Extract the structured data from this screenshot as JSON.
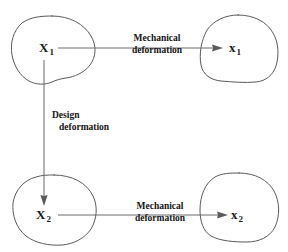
{
  "figure": {
    "type": "diagram",
    "title": "",
    "background_color": "#ffffff",
    "stroke_color": "#5a5a5a",
    "text_color": "#1a1a1a"
  },
  "nodes": [
    {
      "id": "X1",
      "label_main": "X",
      "label_sub": "1",
      "position": "top-left",
      "shape": "irregular-blob"
    },
    {
      "id": "x1",
      "label_main": "x",
      "label_sub": "1",
      "position": "top-right",
      "shape": "irregular-blob"
    },
    {
      "id": "X2",
      "label_main": "X",
      "label_sub": "2",
      "position": "bottom-left",
      "shape": "irregular-blob"
    },
    {
      "id": "x2",
      "label_main": "x",
      "label_sub": "2",
      "position": "bottom-right",
      "shape": "irregular-blob"
    }
  ],
  "edges": [
    {
      "id": "top-mechanical",
      "from": "X1",
      "to": "x1",
      "direction": "horizontal-right",
      "label_line1": "Mechanical",
      "label_line2": "deformation"
    },
    {
      "id": "design",
      "from": "X1",
      "to": "X2",
      "direction": "vertical-down",
      "label_line1": "Design",
      "label_line2": "deformation"
    },
    {
      "id": "bottom-mechanical",
      "from": "X2",
      "to": "x2",
      "direction": "horizontal-right",
      "label_line1": "Mechanical",
      "label_line2": "deformation"
    }
  ]
}
